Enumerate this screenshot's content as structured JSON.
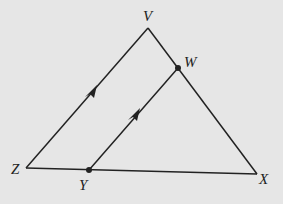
{
  "diagram": {
    "type": "triangle-with-parallel-segment",
    "background": "#e6e6e6",
    "stroke": "#222222",
    "points": {
      "V": {
        "label": "V",
        "x": 148,
        "y": 28
      },
      "W": {
        "label": "W",
        "x": 178,
        "y": 68
      },
      "X": {
        "label": "X",
        "x": 257,
        "y": 174
      },
      "Y": {
        "label": "Y",
        "x": 89,
        "y": 170
      },
      "Z": {
        "label": "Z",
        "x": 26,
        "y": 168
      }
    },
    "segments": [
      "ZV",
      "VX",
      "ZX",
      "YW"
    ],
    "parallel_marks": [
      "ZV",
      "YW"
    ],
    "dots": [
      "W",
      "Y"
    ]
  }
}
